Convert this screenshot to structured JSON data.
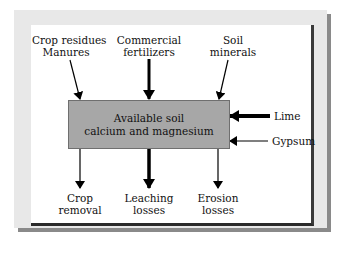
{
  "diagram": {
    "center": {
      "line1": "Available soil",
      "line2": "calcium and magnesium"
    },
    "inputs_top": [
      {
        "line1": "Crop residues",
        "line2": "Manures",
        "arrow_weight": "thin"
      },
      {
        "line1": "Commercial",
        "line2": "fertilizers",
        "arrow_weight": "thick"
      },
      {
        "line1": "Soil",
        "line2": "minerals",
        "arrow_weight": "thin"
      }
    ],
    "inputs_right": [
      {
        "label": "Lime",
        "arrow_weight": "thick"
      },
      {
        "label": "Gypsum",
        "arrow_weight": "thin"
      }
    ],
    "outputs_bottom": [
      {
        "line1": "Crop",
        "line2": "removal",
        "arrow_weight": "thin"
      },
      {
        "line1": "Leaching",
        "line2": "losses",
        "arrow_weight": "thick"
      },
      {
        "line1": "Erosion",
        "line2": "losses",
        "arrow_weight": "thin"
      }
    ],
    "colors": {
      "box_fill": "#a7a7a7",
      "frame": "#e8e8e8",
      "shadow": "#8a8a8a",
      "arrow": "#000000"
    }
  }
}
